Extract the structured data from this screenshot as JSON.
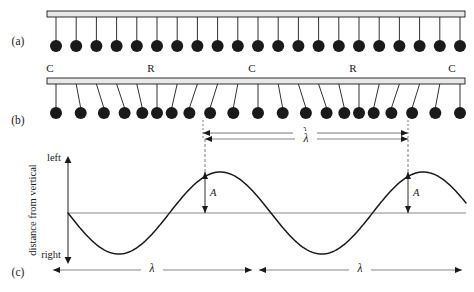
{
  "figure": {
    "background_color": "#ffffff",
    "ink_color": "#1a1a1a",
    "bar_fill_color": "#e8e8e8",
    "bob_color": "#1a1a1a"
  },
  "panels": [
    {
      "tag": "(a)",
      "tag_x": 18,
      "tag_y": 45,
      "description": "undisturbed row of pendulums hanging vertically",
      "bar": {
        "x": 47,
        "y": 11,
        "width": 418,
        "height": 6
      },
      "bob_y": 46,
      "bob_radius": 6.0,
      "rod_top_y": 17,
      "count": 21,
      "first_x": 56,
      "spacing": 20.2,
      "offsets": [
        0,
        0,
        0,
        0,
        0,
        0,
        0,
        0,
        0,
        0,
        0,
        0,
        0,
        0,
        0,
        0,
        0,
        0,
        0,
        0,
        0
      ]
    },
    {
      "tag": "(b)",
      "tag_x": 18,
      "tag_y": 124,
      "description": "displaced pendulums forming compressions and rarefactions",
      "bar": {
        "x": 47,
        "y": 78,
        "width": 418,
        "height": 6
      },
      "bob_y": 113,
      "bob_radius": 6.0,
      "rod_top_y": 84,
      "count": 21,
      "first_x": 56,
      "spacing": 20.2,
      "offsets": [
        0,
        4.5,
        7.5,
        8.0,
        5.5,
        0,
        -5.5,
        -8.0,
        -7.5,
        -4.5,
        0,
        4.5,
        7.5,
        8.0,
        5.5,
        0,
        -5.5,
        -8.0,
        -7.5,
        -4.5,
        0
      ]
    },
    {
      "tag": "(c)",
      "tag_x": 18,
      "tag_y": 276,
      "description": "graph of displacement from vertical versus position"
    }
  ],
  "compression_row": {
    "labels": [
      {
        "text": "C",
        "x": 50,
        "y": 72
      },
      {
        "text": "R",
        "x": 151,
        "y": 72
      },
      {
        "text": "C",
        "x": 252,
        "y": 72
      },
      {
        "text": "R",
        "x": 353,
        "y": 72
      },
      {
        "text": "C",
        "x": 452,
        "y": 72
      }
    ],
    "legend": {
      "C": "compression",
      "R": "rarefaction"
    }
  },
  "wavelength_markers": [
    {
      "id": "lambda-panel-b",
      "label": "λ",
      "x1": 203,
      "x2": 408,
      "y": 133,
      "label_x": 305,
      "label_y": 131
    },
    {
      "id": "lambda-graph-top",
      "label": "λ",
      "x1": 205,
      "x2": 408,
      "y": 139,
      "label_x": 306,
      "label_y": 137
    },
    {
      "id": "lambda-bottom-left",
      "label": "λ",
      "x1": 53,
      "x2": 252,
      "y": 270,
      "label_x": 152,
      "label_y": 268
    },
    {
      "id": "lambda-bottom-right",
      "label": "λ",
      "x1": 259,
      "x2": 462,
      "y": 270,
      "label_x": 360,
      "label_y": 268
    }
  ],
  "amplitude_markers": [
    {
      "id": "amplitude-left",
      "label": "A",
      "x": 205,
      "y_top": 172,
      "y_bottom": 213,
      "label_x": 210,
      "label_y": 196
    },
    {
      "id": "amplitude-right",
      "label": "A",
      "x": 408,
      "y_top": 172,
      "y_bottom": 213,
      "label_x": 413,
      "label_y": 196
    }
  ],
  "chart_data": {
    "type": "line",
    "title": "",
    "xlabel": "",
    "ylabel": "distance from vertical",
    "y_axis_top_label": "left",
    "y_axis_bottom_label": "right",
    "grid": false,
    "legend": "none",
    "axis": {
      "x_zero_line_y": 213,
      "x_start": 68,
      "x_end": 466,
      "y_axis_x": 68,
      "y_top": 158,
      "y_bottom": 262
    },
    "wave": {
      "form": "negative sine",
      "amplitude_px": 41,
      "wavelength_px": 203,
      "phase_zero_x": 68,
      "peaks_x": [
        205,
        408
      ],
      "troughs_x": [
        103,
        306
      ],
      "zero_crossings_x": [
        68,
        154,
        256,
        358,
        460
      ]
    },
    "x": [
      0,
      0.125,
      0.25,
      0.375,
      0.5,
      0.625,
      0.75,
      0.875,
      1.0,
      1.125,
      1.25,
      1.375,
      1.5,
      1.625,
      1.75,
      1.875,
      2.0
    ],
    "y": [
      0,
      -0.707,
      -1.0,
      -0.707,
      0,
      0.707,
      1.0,
      0.707,
      0,
      -0.707,
      -1.0,
      -0.707,
      0,
      0.707,
      1.0,
      0.707,
      0
    ],
    "ylim": [
      -1.25,
      1.25
    ],
    "xlim": [
      0,
      2.0
    ]
  }
}
